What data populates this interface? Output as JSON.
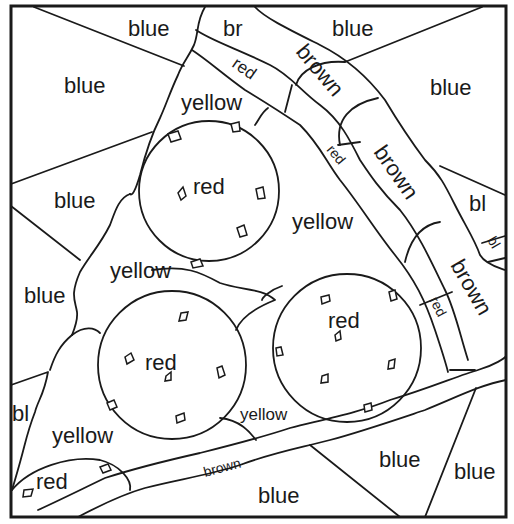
{
  "worksheet": {
    "type": "color-by-word",
    "subject": "pizza slice",
    "line_color": "#1a1a1a",
    "background": "#ffffff"
  },
  "labels": {
    "blue_top": "blue",
    "br_top": "br",
    "blue_top_right": "blue",
    "blue_upper_left": "blue",
    "red_crust_1": "red",
    "brown_crust_1": "brown",
    "blue_right": "blue",
    "yellow_top": "yellow",
    "red_pepperoni_1": "red",
    "red_crust_2": "red",
    "brown_crust_2": "brown",
    "blue_left_mid": "blue",
    "yellow_mid": "yellow",
    "bl_right": "bl",
    "bl_right_small": "bl",
    "yellow_left": "yellow",
    "brown_crust_3": "brown",
    "blue_left_lower": "blue",
    "red_pepperoni_2": "red",
    "red_pepperoni_3": "red",
    "red_crust_3": "red",
    "bl_left": "bl",
    "yellow_bottom_mid": "yellow",
    "yellow_bottom_left": "yellow",
    "red_bottom_left": "red",
    "brown_bottom": "brown",
    "blue_bottom_mid": "blue",
    "blue_bottom_right": "blue",
    "blue_bottom": "blue"
  },
  "legend_colors": {
    "blue": "#3a6fd8",
    "red": "#d83a3a",
    "yellow": "#f2d23a",
    "brown": "#8b5a2b"
  }
}
